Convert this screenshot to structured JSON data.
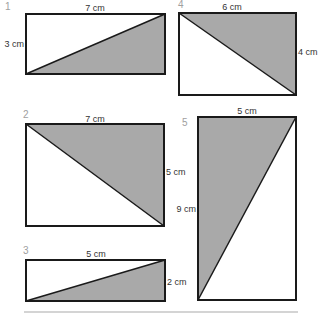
{
  "colors": {
    "shade": "#a9a9a9",
    "stroke": "#1a1a1a",
    "label": "#333333",
    "number": "#a0a0a0",
    "rule": "#aaaaaa"
  },
  "figures": [
    {
      "number": "1",
      "width_label": "7 cm",
      "height_label": "3 cm",
      "rect": [
        26,
        14,
        139,
        60
      ],
      "shaded": "bottom-right"
    },
    {
      "number": "2",
      "width_label": "7 cm",
      "height_label": "5 cm",
      "rect": [
        26,
        124,
        138,
        102
      ],
      "shaded": "top-right"
    },
    {
      "number": "3",
      "width_label": "5 cm",
      "height_label": "2 cm",
      "rect": [
        26,
        260,
        139,
        41
      ],
      "shaded": "bottom-right"
    },
    {
      "number": "4",
      "width_label": "6 cm",
      "height_label": "4 cm",
      "rect": [
        179,
        13,
        117,
        82
      ],
      "shaded": "top-right"
    },
    {
      "number": "5",
      "width_label": "5 cm",
      "height_label": "9 cm",
      "rect": [
        198,
        117,
        98,
        183
      ],
      "shaded": "top-left"
    }
  ]
}
